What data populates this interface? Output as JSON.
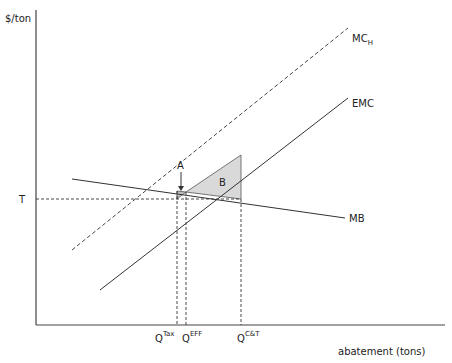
{
  "diagram": {
    "y_axis_label": "$/ton",
    "x_axis_label": "abatement (tons)",
    "price_label": "T",
    "curves": {
      "mch": {
        "label": "MC",
        "subscript": "H",
        "style": "dashed"
      },
      "emc": {
        "label": "EMC",
        "style": "solid"
      },
      "mb": {
        "label": "MB",
        "style": "solid"
      }
    },
    "regions": {
      "a": {
        "label": "A",
        "fill": "#d9d9d9"
      },
      "b": {
        "label": "B",
        "fill": "#d9d9d9"
      }
    },
    "quantities": [
      {
        "label": "Q",
        "superscript": "Tax"
      },
      {
        "label": "Q",
        "superscript": "EFF"
      },
      {
        "label": "Q",
        "superscript": "C&T"
      }
    ]
  }
}
